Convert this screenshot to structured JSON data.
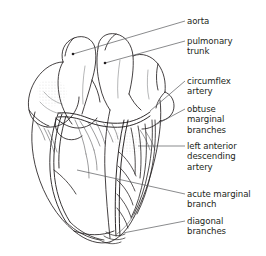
{
  "figure": {
    "background_color": "#ffffff",
    "ink_color": "#231f20",
    "leader_color": "#58595b",
    "width": 266,
    "height": 256
  },
  "labels": [
    {
      "id": "aorta",
      "text": "aorta",
      "x": 187,
      "y": 16,
      "leader": {
        "x1": 185,
        "y1": 21,
        "x2": 73,
        "y2": 54,
        "dot": true
      }
    },
    {
      "id": "pulmonary-trunk",
      "text": "pulmonary\ntrunk",
      "x": 187,
      "y": 36,
      "leader": {
        "x1": 185,
        "y1": 41,
        "x2": 105,
        "y2": 63,
        "dot": true
      }
    },
    {
      "id": "circumflex-artery",
      "text": "circumflex\nartery",
      "x": 187,
      "y": 76,
      "leader": {
        "x1": 185,
        "y1": 81,
        "x2": 150,
        "y2": 111,
        "dot": false
      }
    },
    {
      "id": "obtuse-marginal-branches",
      "text": "obtuse\nmarginal\nbranches",
      "x": 187,
      "y": 104,
      "leader": {
        "x1": 185,
        "y1": 109,
        "x2": 157,
        "y2": 124,
        "dot": false
      }
    },
    {
      "id": "left-anterior-descending-artery",
      "text": "left anterior\ndescending\nartery",
      "x": 187,
      "y": 141,
      "leader": {
        "x1": 185,
        "y1": 146,
        "x2": 138,
        "y2": 146,
        "dot": false
      }
    },
    {
      "id": "acute-marginal-branch",
      "text": "acute marginal\nbranch",
      "x": 187,
      "y": 189,
      "leader": {
        "x1": 185,
        "y1": 194,
        "x2": 77,
        "y2": 170,
        "dot": false
      }
    },
    {
      "id": "diagonal-branches",
      "text": "diagonal\nbranches",
      "x": 187,
      "y": 216,
      "leader": {
        "x1": 185,
        "y1": 221,
        "x2": 123,
        "y2": 233,
        "dot": false
      }
    }
  ],
  "structures": [
    {
      "id": "aorta",
      "name": "aorta"
    },
    {
      "id": "pulmonary-trunk",
      "name": "pulmonary trunk"
    },
    {
      "id": "left-atrial-appendage",
      "name": "left atrial appendage"
    },
    {
      "id": "right-atrium",
      "name": "right atrium"
    },
    {
      "id": "right-ventricle",
      "name": "right ventricle"
    },
    {
      "id": "left-ventricle",
      "name": "left ventricle"
    },
    {
      "id": "circumflex-artery",
      "name": "circumflex artery"
    },
    {
      "id": "obtuse-marginal-branches",
      "name": "obtuse marginal branches"
    },
    {
      "id": "left-anterior-descending-artery",
      "name": "left anterior descending artery"
    },
    {
      "id": "acute-marginal-branch",
      "name": "acute marginal branch"
    },
    {
      "id": "diagonal-branches",
      "name": "diagonal branches"
    },
    {
      "id": "right-coronary-artery",
      "name": "right coronary artery"
    }
  ]
}
